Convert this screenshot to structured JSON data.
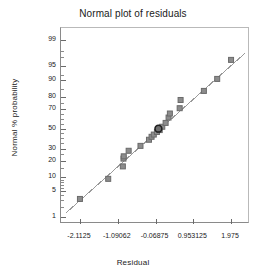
{
  "chart_data": {
    "type": "scatter",
    "title": "Normal plot of residuals",
    "xlabel": "Residual",
    "ylabel": "Normal % probability",
    "grid": false,
    "legend": null,
    "xlim": [
      -2.625,
      2.4875
    ],
    "xticks": [
      -2.1125,
      -1.09062,
      -0.06875,
      0.953125,
      1.975
    ],
    "xtick_labels": [
      "-2.1125",
      "-1.09062",
      "-0.06875",
      "0.953125",
      "1.975"
    ],
    "yscale": "probit",
    "ylim": [
      0.6,
      99.6
    ],
    "yticks": [
      1,
      5,
      10,
      20,
      30,
      50,
      70,
      80,
      90,
      95,
      99
    ],
    "ytick_labels": [
      "1",
      "5",
      "10",
      "20",
      "30",
      "50",
      "70",
      "80",
      "90",
      "95",
      "99"
    ],
    "reference_line": {
      "x": [
        -2.48,
        2.36
      ],
      "y": [
        1.35,
        97.7
      ],
      "color": "#9a9a9a"
    },
    "series": [
      {
        "name": "residuals",
        "marker": "square",
        "color": "#8c8c8c",
        "edge_color": "#6a6a6a",
        "points": [
          {
            "x": -2.1125,
            "y": 3.2
          },
          {
            "x": -1.348,
            "y": 9.3
          },
          {
            "x": -0.952,
            "y": 16.0
          },
          {
            "x": -0.935,
            "y": 21.5
          },
          {
            "x": -0.928,
            "y": 23.3
          },
          {
            "x": -0.795,
            "y": 28.0
          },
          {
            "x": -0.475,
            "y": 32.5
          },
          {
            "x": -0.245,
            "y": 38.5
          },
          {
            "x": -0.175,
            "y": 41.5
          },
          {
            "x": -0.115,
            "y": 43.8
          },
          {
            "x": -0.03,
            "y": 46.5
          },
          {
            "x": 0.045,
            "y": 48.5
          },
          {
            "x": 0.115,
            "y": 52.0
          },
          {
            "x": 0.205,
            "y": 56.0
          },
          {
            "x": 0.285,
            "y": 61.5
          },
          {
            "x": 0.32,
            "y": 65.5
          },
          {
            "x": 0.585,
            "y": 70.5
          },
          {
            "x": 0.61,
            "y": 77.5
          },
          {
            "x": 1.24,
            "y": 84.0
          },
          {
            "x": 1.6,
            "y": 90.5
          },
          {
            "x": 1.975,
            "y": 96.5
          }
        ]
      },
      {
        "name": "highlighted-residual",
        "marker": "circle",
        "color": "#6f6f6f",
        "edge_color": "#1f1f1f",
        "points": [
          {
            "x": 0.01,
            "y": 50.0
          }
        ]
      }
    ]
  }
}
